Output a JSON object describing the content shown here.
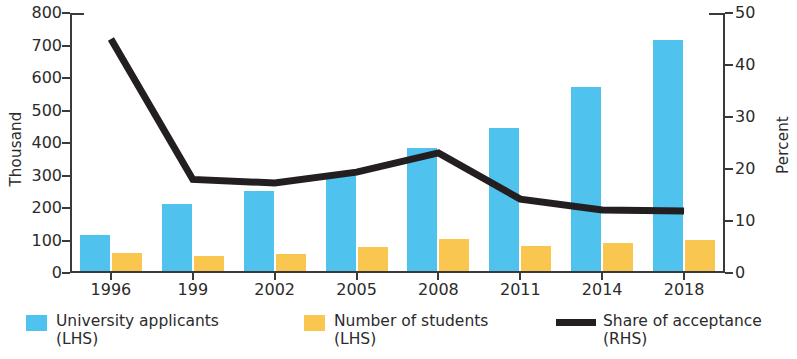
{
  "chart_data": {
    "type": "bar",
    "title": "",
    "subtitle": "",
    "xlabel": "",
    "ylabel": "Thousand",
    "y2label": "Percent",
    "categories": [
      "1996",
      "199",
      "2002",
      "2005",
      "2008",
      "2011",
      "2014",
      "2018"
    ],
    "ylim": [
      0,
      800
    ],
    "yticks": [
      0,
      100,
      200,
      300,
      400,
      500,
      600,
      700,
      800
    ],
    "ytick_labels": [
      "0",
      "100",
      "200",
      "300",
      "400",
      "500",
      "600",
      "700",
      "800"
    ],
    "y2lim": [
      0,
      50
    ],
    "y2ticks": [
      0,
      10,
      20,
      30,
      40,
      50
    ],
    "y2tick_labels": [
      "0",
      "10",
      "20",
      "30",
      "40",
      "50"
    ],
    "grid": false,
    "legend_position": "bottom",
    "series": [
      {
        "name": "University applicants\n(LHS)",
        "type": "bar",
        "axis": "left",
        "color": "#4fc2ee",
        "values": [
          110,
          205,
          245,
          300,
          380,
          440,
          565,
          710
        ]
      },
      {
        "name": "Number of students\n(LHS)",
        "type": "bar",
        "axis": "left",
        "color": "#f9c74f",
        "values": [
          55,
          46,
          52,
          74,
          100,
          78,
          85,
          95
        ]
      },
      {
        "name": "Share of acceptance\n(RHS)",
        "type": "line",
        "axis": "right",
        "color": "#231f20",
        "values": [
          45.0,
          18.0,
          17.3,
          19.4,
          23.1,
          14.2,
          12.1,
          11.9
        ]
      }
    ]
  },
  "axes": {
    "left_title": "Thousand",
    "right_title": "Percent"
  },
  "legend": {
    "items": [
      {
        "label": "University applicants\n(LHS)",
        "marker": "square-swatch",
        "color": "#4fc2ee"
      },
      {
        "label": "Number of students\n(LHS)",
        "marker": "square-swatch",
        "color": "#f9c74f"
      },
      {
        "label": "Share of acceptance\n(RHS)",
        "marker": "line-swatch",
        "color": "#231f20"
      }
    ]
  }
}
